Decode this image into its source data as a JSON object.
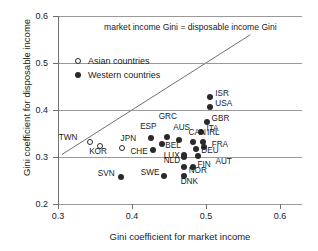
{
  "chart_data": {
    "type": "scatter",
    "title": "",
    "xlabel": "Gini coefficient for market income",
    "ylabel": "Gini coefficient for disposable income",
    "xlim": [
      0.3,
      0.63
    ],
    "ylim": [
      0.2,
      0.6
    ],
    "xticks": [
      "0.3",
      "0.4",
      "0.5",
      "0.6"
    ],
    "xtick_values": [
      0.3,
      0.4,
      0.5,
      0.6
    ],
    "yticks": [
      "0.2",
      "0.3",
      "0.4",
      "0.5",
      "0.6"
    ],
    "ytick_values": [
      0.2,
      0.3,
      0.4,
      0.5,
      0.6
    ],
    "grid": "horizontal",
    "legend_position": "top-left-inside",
    "annotations": [
      {
        "text": "market income Gini = disposable income Gini",
        "kind": "reference-line-label"
      }
    ],
    "reference_line": {
      "description": "45-degree identity line",
      "from": [
        0.305,
        0.305
      ],
      "to": [
        0.56,
        0.56
      ]
    },
    "legend": [
      {
        "key": "asian",
        "label": "Asian countries",
        "marker": "open-circle"
      },
      {
        "key": "western",
        "label": "Western countries",
        "marker": "filled-circle"
      }
    ],
    "series": [
      {
        "name": "Asian countries",
        "marker": "open-circle",
        "points": [
          {
            "code": "TWN",
            "x": 0.343,
            "y": 0.331,
            "label_dx": -31,
            "label_dy": -5
          },
          {
            "code": "KOR",
            "x": 0.357,
            "y": 0.324,
            "label_dx": -11,
            "label_dy": 5
          },
          {
            "code": "JPN",
            "x": 0.386,
            "y": 0.319,
            "label_dx": -1,
            "label_dy": -10
          }
        ]
      },
      {
        "name": "Western countries",
        "marker": "filled-circle",
        "points": [
          {
            "code": "ISR",
            "x": 0.506,
            "y": 0.428,
            "label_dx": 5,
            "label_dy": -4
          },
          {
            "code": "USA",
            "x": 0.506,
            "y": 0.406,
            "label_dx": 5,
            "label_dy": -4
          },
          {
            "code": "GBR",
            "x": 0.501,
            "y": 0.374,
            "label_dx": 5,
            "label_dy": -4
          },
          {
            "code": "ITA",
            "x": 0.494,
            "y": 0.353,
            "label_dx": 5,
            "label_dy": -4
          },
          {
            "code": "AUS",
            "x": 0.464,
            "y": 0.337,
            "label_dx": -6,
            "label_dy": -13
          },
          {
            "code": "GRC",
            "x": 0.447,
            "y": 0.342,
            "label_dx": -8,
            "label_dy": -21
          },
          {
            "code": "ESP",
            "x": 0.426,
            "y": 0.34,
            "label_dx": -11,
            "label_dy": -12
          },
          {
            "code": "CAN",
            "x": 0.482,
            "y": 0.332,
            "label_dx": -4,
            "label_dy": -10
          },
          {
            "code": "IRL",
            "x": 0.496,
            "y": 0.331,
            "label_dx": 4,
            "label_dy": -10
          },
          {
            "code": "BEL",
            "x": 0.441,
            "y": 0.328,
            "label_dx": 3,
            "label_dy": 1
          },
          {
            "code": "FRA",
            "x": 0.497,
            "y": 0.321,
            "label_dx": 8,
            "label_dy": -3
          },
          {
            "code": "DEU",
            "x": 0.487,
            "y": 0.318,
            "label_dx": 5,
            "label_dy": 1
          },
          {
            "code": "CHE",
            "x": 0.429,
            "y": 0.315,
            "label_dx": -23,
            "label_dy": 1
          },
          {
            "code": "LUX",
            "x": 0.47,
            "y": 0.304,
            "label_dx": -20,
            "label_dy": 0
          },
          {
            "code": "AUT",
            "x": 0.49,
            "y": 0.303,
            "label_dx": 17,
            "label_dy": 5
          },
          {
            "code": "NLD",
            "x": 0.47,
            "y": 0.299,
            "label_dx": -20,
            "label_dy": 3
          },
          {
            "code": "FIN",
            "x": 0.482,
            "y": 0.279,
            "label_dx": 5,
            "label_dy": -3
          },
          {
            "code": "NOR",
            "x": 0.47,
            "y": 0.279,
            "label_dx": 5,
            "label_dy": 3
          },
          {
            "code": "DNK",
            "x": 0.47,
            "y": 0.259,
            "label_dx": -3,
            "label_dy": 5
          },
          {
            "code": "SWE",
            "x": 0.443,
            "y": 0.259,
            "label_dx": -23,
            "label_dy": -4
          },
          {
            "code": "SVN",
            "x": 0.385,
            "y": 0.257,
            "label_dx": -23,
            "label_dy": -4
          }
        ]
      }
    ]
  }
}
